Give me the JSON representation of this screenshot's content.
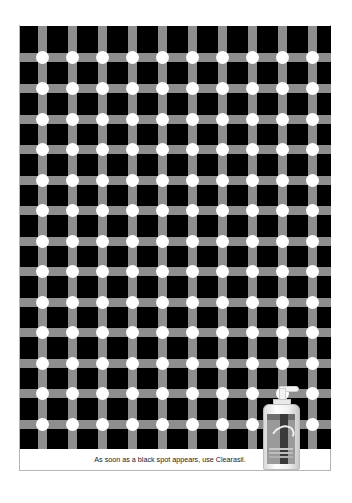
{
  "ad": {
    "caption": "As soon as a black spot appears, use Clearasil.",
    "product": "Clearasil",
    "colors": {
      "background": "#000000",
      "bars": "#8e8e8e",
      "dots": "#ffffff",
      "page": "#ffffff"
    },
    "grid": {
      "columns": 10,
      "rows": 13,
      "vertical_bar_centers_x": [
        42,
        72,
        102,
        132,
        162,
        192,
        222,
        252,
        282,
        312
      ],
      "horizontal_bar_centers_y": [
        57,
        88,
        119,
        149,
        180,
        210,
        241,
        271,
        302,
        332,
        363,
        393,
        424
      ]
    }
  }
}
